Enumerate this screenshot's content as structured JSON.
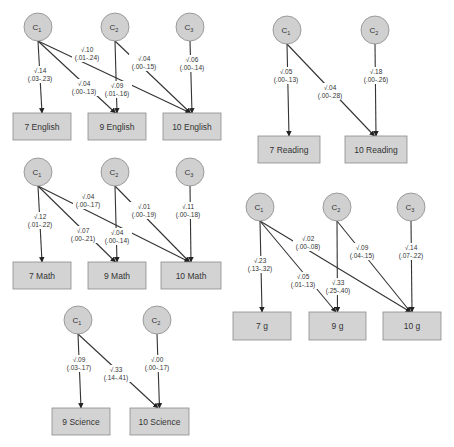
{
  "panels": [
    {
      "name": "English",
      "latents": [
        {
          "label": "C",
          "sub": "1",
          "cx": 38,
          "cy": 27
        },
        {
          "label": "C",
          "sub": "2",
          "cx": 115,
          "cy": 27
        },
        {
          "label": "C",
          "sub": "3",
          "cx": 190,
          "cy": 27
        }
      ],
      "observed": [
        {
          "label": "7 English",
          "x": 13,
          "y": 113,
          "w": 58,
          "h": 27
        },
        {
          "label": "9 English",
          "x": 88,
          "y": 113,
          "w": 58,
          "h": 27
        },
        {
          "label": "10 English",
          "x": 163,
          "y": 113,
          "w": 58,
          "h": 27
        }
      ],
      "paths": [
        {
          "from": 0,
          "to": 0,
          "est": "√.14",
          "ci": "(.03-.23)",
          "lx": 40,
          "ly": 73
        },
        {
          "from": 0,
          "to": 1,
          "est": "√.04",
          "ci": "(.00-.13)",
          "lx": 84,
          "ly": 86
        },
        {
          "from": 0,
          "to": 2,
          "est": "√.10",
          "ci": "(.01-.24)",
          "lx": 87,
          "ly": 52
        },
        {
          "from": 1,
          "to": 1,
          "est": "√.09",
          "ci": "(.01-.16)",
          "lx": 117,
          "ly": 88
        },
        {
          "from": 1,
          "to": 2,
          "est": "√.04",
          "ci": "(.00-.15)",
          "lx": 144,
          "ly": 61
        },
        {
          "from": 2,
          "to": 2,
          "est": "√.06",
          "ci": "(.00-.14)",
          "lx": 192,
          "ly": 62
        }
      ]
    },
    {
      "name": "Math",
      "latents": [
        {
          "label": "C",
          "sub": "1",
          "cx": 38,
          "cy": 172
        },
        {
          "label": "C",
          "sub": "2",
          "cx": 115,
          "cy": 172
        },
        {
          "label": "C",
          "sub": "3",
          "cx": 190,
          "cy": 172
        }
      ],
      "observed": [
        {
          "label": "7 Math",
          "x": 13,
          "y": 262,
          "w": 58,
          "h": 27
        },
        {
          "label": "9 Math",
          "x": 88,
          "y": 262,
          "w": 58,
          "h": 27
        },
        {
          "label": "10 Math",
          "x": 161,
          "y": 262,
          "w": 60,
          "h": 27
        }
      ],
      "paths": [
        {
          "from": 0,
          "to": 0,
          "est": "√.12",
          "ci": "(.01-.22)",
          "lx": 40,
          "ly": 219
        },
        {
          "from": 0,
          "to": 1,
          "est": "√.07",
          "ci": "(.00-.21)",
          "lx": 83,
          "ly": 233
        },
        {
          "from": 0,
          "to": 2,
          "est": "√.04",
          "ci": "(.00-.17)",
          "lx": 88,
          "ly": 199
        },
        {
          "from": 1,
          "to": 1,
          "est": "√.04",
          "ci": "(.00-.14)",
          "lx": 117,
          "ly": 235
        },
        {
          "from": 1,
          "to": 2,
          "est": "√.01",
          "ci": "(.00-.19)",
          "lx": 144,
          "ly": 209
        },
        {
          "from": 2,
          "to": 2,
          "est": "√.11",
          "ci": "(.00-.18)",
          "lx": 188,
          "ly": 209
        }
      ]
    },
    {
      "name": "Science",
      "latents": [
        {
          "label": "C",
          "sub": "1",
          "cx": 78,
          "cy": 320
        },
        {
          "label": "C",
          "sub": "2",
          "cx": 157,
          "cy": 320
        }
      ],
      "observed": [
        {
          "label": "9 Science",
          "x": 52,
          "y": 408,
          "w": 58,
          "h": 27
        },
        {
          "label": "10 Science",
          "x": 130,
          "y": 408,
          "w": 59,
          "h": 27
        }
      ],
      "paths": [
        {
          "from": 0,
          "to": 0,
          "est": "√.09",
          "ci": "(.03-.17)",
          "lx": 79,
          "ly": 362
        },
        {
          "from": 0,
          "to": 1,
          "est": "√.33",
          "ci": "(.14-.41)",
          "lx": 116,
          "ly": 372
        },
        {
          "from": 1,
          "to": 1,
          "est": "√.00",
          "ci": "(.00-.17)",
          "lx": 157,
          "ly": 362
        }
      ]
    },
    {
      "name": "Reading",
      "latents": [
        {
          "label": "C",
          "sub": "1",
          "cx": 287,
          "cy": 30
        },
        {
          "label": "C",
          "sub": "2",
          "cx": 375,
          "cy": 30
        }
      ],
      "observed": [
        {
          "label": "7 Reading",
          "x": 258,
          "y": 136,
          "w": 62,
          "h": 27
        },
        {
          "label": "10 Reading",
          "x": 345,
          "y": 136,
          "w": 62,
          "h": 27
        }
      ],
      "paths": [
        {
          "from": 0,
          "to": 0,
          "est": "√.05",
          "ci": "(.00-.13)",
          "lx": 286,
          "ly": 74
        },
        {
          "from": 0,
          "to": 1,
          "est": "√.04",
          "ci": "(.00-.28)",
          "lx": 330,
          "ly": 90
        },
        {
          "from": 1,
          "to": 1,
          "est": "√.18",
          "ci": "(.00-.26)",
          "lx": 376,
          "ly": 74
        }
      ]
    },
    {
      "name": "g",
      "latents": [
        {
          "label": "C",
          "sub": "1",
          "cx": 260,
          "cy": 207
        },
        {
          "label": "C",
          "sub": "2",
          "cx": 337,
          "cy": 207
        },
        {
          "label": "C",
          "sub": "3",
          "cx": 411,
          "cy": 207
        }
      ],
      "observed": [
        {
          "label": "7 g",
          "x": 233,
          "y": 312,
          "w": 58,
          "h": 28
        },
        {
          "label": "9 g",
          "x": 309,
          "y": 312,
          "w": 57,
          "h": 28
        },
        {
          "label": "10 g",
          "x": 383,
          "y": 312,
          "w": 58,
          "h": 28
        }
      ],
      "paths": [
        {
          "from": 0,
          "to": 0,
          "est": "√.23",
          "ci": "(.13-.32)",
          "lx": 260,
          "ly": 263
        },
        {
          "from": 0,
          "to": 1,
          "est": "√.05",
          "ci": "(.01-.13)",
          "lx": 303,
          "ly": 279
        },
        {
          "from": 0,
          "to": 2,
          "est": "√.02",
          "ci": "(.00-.08)",
          "lx": 308,
          "ly": 241
        },
        {
          "from": 1,
          "to": 1,
          "est": "√.33",
          "ci": "(.25-.40)",
          "lx": 338,
          "ly": 285
        },
        {
          "from": 1,
          "to": 2,
          "est": "√.09",
          "ci": "(.04-.15)",
          "lx": 362,
          "ly": 250
        },
        {
          "from": 2,
          "to": 2,
          "est": "√.14",
          "ci": "(.07-.22)",
          "lx": 411,
          "ly": 250
        }
      ]
    }
  ]
}
